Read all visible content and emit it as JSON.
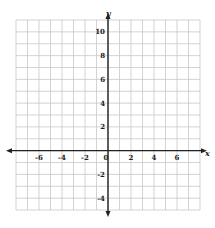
{
  "chart_data": {
    "type": "scatter",
    "title": "",
    "xlabel": "x",
    "ylabel": "y",
    "xlim": [
      -8,
      8
    ],
    "ylim": [
      -5,
      11
    ],
    "grid": true,
    "grid_step": 1,
    "x_ticks": [
      -6,
      -4,
      -2,
      0,
      2,
      4,
      6
    ],
    "y_ticks": [
      -4,
      -2,
      2,
      4,
      6,
      8,
      10
    ],
    "x_tick_labels": [
      "-6",
      "-4",
      "-2",
      "0",
      "2",
      "4",
      "6"
    ],
    "y_tick_labels": [
      "-4",
      "-2",
      "2",
      "4",
      "6",
      "8",
      "10"
    ],
    "series": [],
    "legend": null
  },
  "colors": {
    "grid": "#c8c8c8",
    "axis": "#222222",
    "background": "#ffffff"
  }
}
